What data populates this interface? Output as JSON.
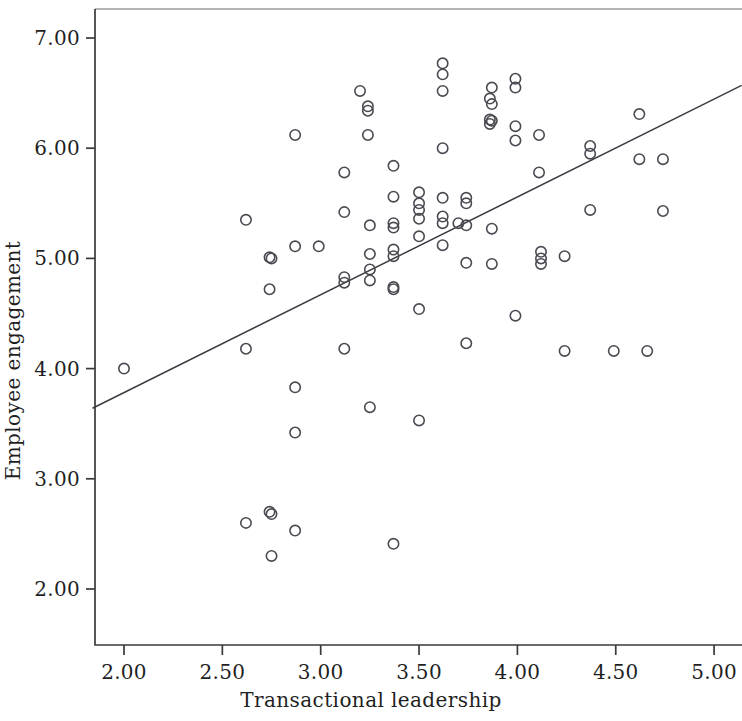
{
  "chart_data": {
    "type": "scatter",
    "title": "",
    "xlabel": "Transactional leadership",
    "ylabel": "Employee engagement",
    "xlim": [
      1.82,
      5.12
    ],
    "ylim": [
      1.79,
      7.22
    ],
    "xticks": [
      "2.00",
      "2.50",
      "3.00",
      "3.50",
      "4.00",
      "4.50",
      "5.00"
    ],
    "xtick_values": [
      2.0,
      2.5,
      3.0,
      3.5,
      4.0,
      4.5,
      5.0
    ],
    "yticks": [
      "2.00",
      "3.00",
      "4.00",
      "5.00",
      "6.00",
      "7.00"
    ],
    "ytick_values": [
      2.0,
      3.0,
      4.0,
      5.0,
      6.0,
      7.0
    ],
    "grid": false,
    "legend": null,
    "marker": "open-circle",
    "marker_color": "#4a4a52",
    "fit_line": {
      "type": "linear",
      "color": "#3c3c44",
      "x_start": 1.84,
      "y_start": 3.64,
      "x_end": 5.14,
      "y_end": 6.57,
      "slope": 0.888,
      "intercept": 2.006
    },
    "x": [
      2.0,
      2.62,
      2.62,
      2.62,
      2.74,
      2.74,
      2.74,
      2.75,
      2.75,
      2.75,
      2.87,
      2.87,
      2.87,
      2.87,
      2.87,
      2.99,
      3.12,
      3.12,
      3.12,
      3.12,
      3.12,
      3.2,
      3.24,
      3.24,
      3.24,
      3.25,
      3.25,
      3.25,
      3.25,
      3.25,
      3.37,
      3.37,
      3.37,
      3.37,
      3.37,
      3.37,
      3.37,
      3.37,
      3.37,
      3.5,
      3.5,
      3.5,
      3.5,
      3.5,
      3.5,
      3.5,
      3.62,
      3.62,
      3.62,
      3.62,
      3.62,
      3.62,
      3.62,
      3.62,
      3.7,
      3.74,
      3.74,
      3.74,
      3.74,
      3.74,
      3.86,
      3.86,
      3.86,
      3.87,
      3.87,
      3.87,
      3.87,
      3.87,
      3.99,
      3.99,
      3.99,
      3.99,
      3.99,
      4.11,
      4.11,
      4.12,
      4.12,
      4.12,
      4.24,
      4.24,
      4.37,
      4.37,
      4.37,
      4.49,
      4.62,
      4.62,
      4.66,
      4.74,
      4.74
    ],
    "y": [
      4.0,
      5.35,
      4.18,
      2.6,
      5.01,
      4.72,
      2.7,
      5.0,
      2.3,
      2.68,
      6.12,
      5.11,
      3.83,
      3.42,
      2.53,
      5.11,
      5.78,
      5.42,
      4.83,
      4.18,
      4.78,
      6.52,
      6.38,
      6.34,
      6.12,
      5.3,
      4.9,
      4.8,
      5.04,
      3.65,
      5.84,
      5.56,
      5.32,
      5.28,
      5.08,
      5.02,
      4.74,
      4.72,
      2.41,
      5.6,
      5.5,
      5.44,
      5.36,
      5.2,
      4.54,
      3.53,
      6.77,
      6.67,
      6.52,
      6.0,
      5.55,
      5.38,
      5.32,
      5.12,
      5.32,
      5.55,
      5.5,
      5.3,
      4.96,
      4.23,
      6.45,
      6.26,
      6.22,
      6.55,
      6.4,
      6.25,
      5.27,
      4.95,
      6.63,
      6.55,
      6.2,
      6.07,
      4.48,
      6.12,
      5.78,
      5.06,
      5.0,
      4.95,
      5.02,
      4.16,
      6.02,
      5.95,
      5.44,
      4.16,
      6.31,
      5.9,
      4.16,
      5.9,
      5.43
    ],
    "n_points": 89
  },
  "axes": {
    "x_title": "Transactional leadership",
    "y_title": "Employee engagement"
  }
}
